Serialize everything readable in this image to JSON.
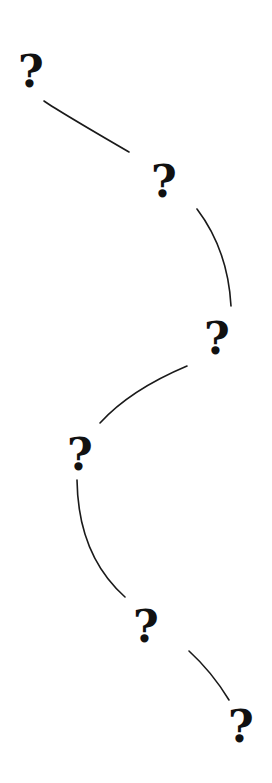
{
  "diagram": {
    "background": "#ffffff",
    "ink_color": "#111111",
    "nodes": [
      {
        "id": "q1",
        "label": "?",
        "cx": 31,
        "cy": 72
      },
      {
        "id": "q2",
        "label": "?",
        "cx": 164,
        "cy": 182
      },
      {
        "id": "q3",
        "label": "?",
        "cx": 217,
        "cy": 339
      },
      {
        "id": "q4",
        "label": "?",
        "cx": 80,
        "cy": 455
      },
      {
        "id": "q5",
        "label": "?",
        "cx": 146,
        "cy": 627
      },
      {
        "id": "q6",
        "label": "?",
        "cx": 241,
        "cy": 727
      }
    ],
    "edges": [
      {
        "from": "q1",
        "to": "q2",
        "path": "M44,101 Q60,112 129,152"
      },
      {
        "from": "q2",
        "to": "q3",
        "path": "M197,209 Q228,250 231,306"
      },
      {
        "from": "q3",
        "to": "q4",
        "path": "M187,366 Q130,390 100,423"
      },
      {
        "from": "q4",
        "to": "q5",
        "path": "M77,480 Q78,555 125,597"
      },
      {
        "from": "q5",
        "to": "q6",
        "path": "M189,651 Q212,672 229,700"
      }
    ]
  }
}
